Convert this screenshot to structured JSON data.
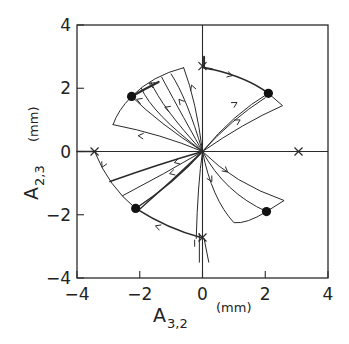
{
  "chart_data": {
    "type": "line",
    "title": "",
    "xlabel": "A_{3,2}",
    "xlabel_main": "A",
    "xlabel_sub": "3,2",
    "xlabel_unit": "(mm)",
    "ylabel": "A_{2,3}",
    "ylabel_main": "A",
    "ylabel_sub": "2,3",
    "ylabel_unit": "(mm)",
    "xlim": [
      -4,
      4
    ],
    "ylim": [
      -4,
      4
    ],
    "x_ticks": [
      -4,
      -2,
      0,
      2,
      4
    ],
    "y_ticks": [
      -4,
      -2,
      0,
      2,
      4
    ],
    "x_tick_labels": [
      "−4",
      "−2",
      "0",
      "2",
      "4"
    ],
    "y_tick_labels": [
      "4",
      "2",
      "0",
      "−2",
      "−4"
    ],
    "grid": false,
    "legend": null,
    "stable_points": [
      {
        "x": -2.26,
        "y": 1.74
      },
      {
        "x": 2.1,
        "y": 1.84
      },
      {
        "x": -2.13,
        "y": -1.8
      },
      {
        "x": 2.04,
        "y": -1.9
      }
    ],
    "saddle_points": [
      {
        "x": 0.0,
        "y": 2.7
      },
      {
        "x": 3.06,
        "y": 0.0
      },
      {
        "x": -3.44,
        "y": 0.0
      },
      {
        "x": 0.0,
        "y": -2.72
      }
    ],
    "series": [
      {
        "name": "separatrix-upper-left",
        "points": [
          [
            0.0,
            2.7
          ],
          [
            -0.6,
            2.6
          ],
          [
            -1.3,
            2.3
          ],
          [
            -1.9,
            2.0
          ],
          [
            -2.26,
            1.74
          ]
        ]
      },
      {
        "name": "separatrix-left-upper",
        "points": [
          [
            -3.44,
            0.0
          ],
          [
            -3.15,
            0.55
          ],
          [
            -2.9,
            0.9
          ],
          [
            -2.26,
            1.74
          ]
        ]
      },
      {
        "name": "separatrix-upper-right",
        "points": [
          [
            0.0,
            2.7
          ],
          [
            0.8,
            2.5
          ],
          [
            1.5,
            2.2
          ],
          [
            2.1,
            1.84
          ]
        ]
      },
      {
        "name": "separatrix-left-lower",
        "points": [
          [
            -3.44,
            0.0
          ],
          [
            -3.2,
            -0.6
          ],
          [
            -2.8,
            -1.2
          ],
          [
            -2.13,
            -1.8
          ]
        ]
      },
      {
        "name": "separatrix-lower-left",
        "points": [
          [
            0.0,
            -2.72
          ],
          [
            -0.7,
            -2.55
          ],
          [
            -1.4,
            -2.25
          ],
          [
            -2.13,
            -1.8
          ]
        ]
      },
      {
        "name": "separatrix-lower-right",
        "points": [
          [
            0.0,
            -2.72
          ]
        ]
      }
    ]
  }
}
